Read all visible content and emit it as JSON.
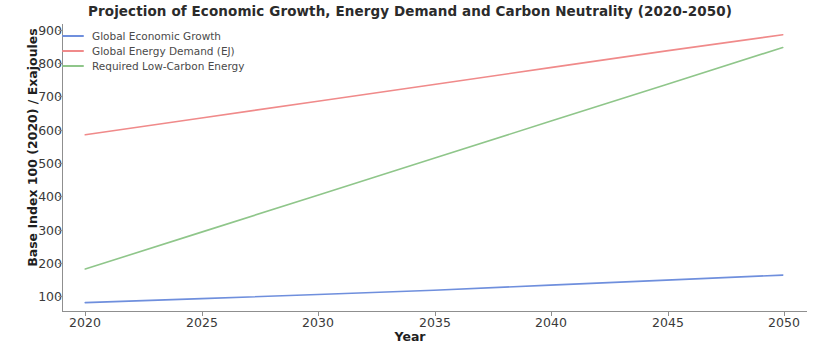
{
  "chart_data": {
    "type": "line",
    "title": "Projection of Economic Growth, Energy Demand and Carbon Neutrality (2020-2050)",
    "xlabel": "Year",
    "ylabel": "Base Index 100 (2020) / Exajoules",
    "xlim": [
      2019,
      2051
    ],
    "ylim": [
      75,
      930
    ],
    "grid": false,
    "legend_position": "upper left",
    "x": [
      2020,
      2025,
      2030,
      2035,
      2040,
      2045,
      2050
    ],
    "xticks": [
      "2020",
      "2025",
      "2030",
      "2035",
      "2040",
      "2045",
      "2050"
    ],
    "yticks": [
      "100",
      "200",
      "300",
      "400",
      "500",
      "600",
      "700",
      "800",
      "900"
    ],
    "ytick_values": [
      100,
      200,
      300,
      400,
      500,
      600,
      700,
      800,
      900
    ],
    "series": [
      {
        "name": "Global Economic Growth",
        "color": "#6f8fdd",
        "values": [
          100,
          112,
          124,
          137,
          152,
          167,
          182
        ]
      },
      {
        "name": "Global Energy Demand (EJ)",
        "color": "#f08a8a",
        "values": [
          600,
          650,
          700,
          750,
          800,
          850,
          898
        ]
      },
      {
        "name": "Required Low-Carbon Energy",
        "color": "#8fc68a",
        "values": [
          200,
          310,
          420,
          530,
          640,
          750,
          860
        ]
      }
    ]
  },
  "figure": {
    "background": "#ffffff",
    "axis_color": "#8f8f8f",
    "title_color": "#2b2b2b"
  }
}
